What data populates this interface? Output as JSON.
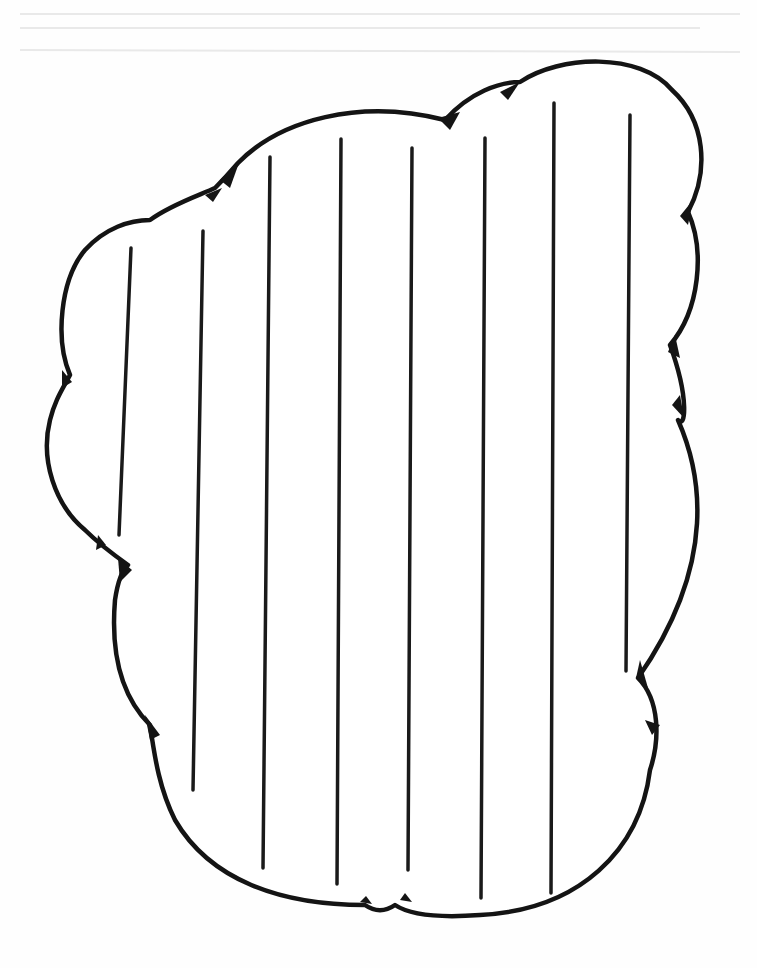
{
  "page": {
    "kind": "cloud-shaped writing paper template",
    "background_color": "#ffffff",
    "ink_color": "#141414"
  },
  "cloud": {
    "description": "cloud outline with scalloped edges and small pointed cusps",
    "stroke_width": 4.5
  },
  "writing_lines": [
    {
      "x1": 131,
      "y1": 248,
      "x2": 119,
      "y2": 535
    },
    {
      "x1": 203,
      "y1": 231,
      "x2": 193,
      "y2": 790
    },
    {
      "x1": 270,
      "y1": 157,
      "x2": 263,
      "y2": 868
    },
    {
      "x1": 341,
      "y1": 139,
      "x2": 337,
      "y2": 884
    },
    {
      "x1": 412,
      "y1": 148,
      "x2": 408,
      "y2": 870
    },
    {
      "x1": 485,
      "y1": 138,
      "x2": 481,
      "y2": 898
    },
    {
      "x1": 554,
      "y1": 103,
      "x2": 551,
      "y2": 893
    },
    {
      "x1": 630,
      "y1": 115,
      "x2": 626,
      "y2": 671
    }
  ]
}
